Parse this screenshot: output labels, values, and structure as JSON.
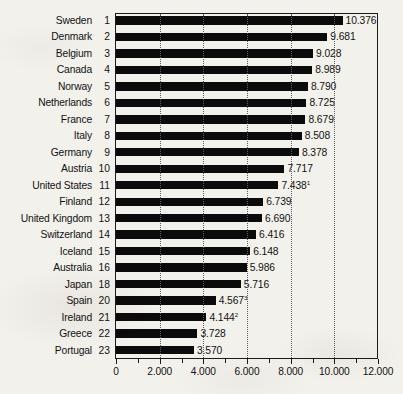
{
  "chart_data": {
    "type": "bar",
    "orientation": "horizontal",
    "title": "",
    "subtitle": "",
    "xlabel": "",
    "ylabel": "",
    "xlim": [
      0,
      12000
    ],
    "xticks": [
      0,
      2000,
      4000,
      6000,
      8000,
      10000,
      12000
    ],
    "xtick_labels": [
      "0",
      "2.000",
      "4.000",
      "6.000",
      "8.000",
      "10.000",
      "12.000"
    ],
    "minor_ticks": [
      1000,
      3000,
      5000,
      7000,
      9000,
      11000
    ],
    "grid": true,
    "grid_axis": "x",
    "grid_style": "dotted",
    "legend": null,
    "bar_color": "#0b0b0b",
    "categories": [
      "Sweden",
      "Denmark",
      "Belgium",
      "Canada",
      "Norway",
      "Netherlands",
      "France",
      "Italy",
      "Germany",
      "Austria",
      "United States",
      "Finland",
      "United Kingdom",
      "Switzerland",
      "Iceland",
      "Australia",
      "Japan",
      "Spain",
      "Ireland",
      "Greece",
      "Portugal"
    ],
    "ranks": [
      "1",
      "2",
      "3",
      "4",
      "5",
      "6",
      "7",
      "8",
      "9",
      "10",
      "11",
      "12",
      "13",
      "14",
      "15",
      "16",
      "18",
      "20",
      "21",
      "22",
      "23"
    ],
    "values": [
      10376,
      9681,
      9028,
      8989,
      8790,
      8725,
      8679,
      8508,
      8378,
      7717,
      7438,
      6739,
      6690,
      6416,
      6148,
      5986,
      5716,
      4567,
      4144,
      3728,
      3570
    ],
    "value_labels": [
      "10.376",
      "9.681",
      "9.028",
      "8.989",
      "8.790",
      "8.725",
      "8.679",
      "8.508",
      "8.378",
      "7.717",
      "7.438",
      "6.739",
      "6.690",
      "6.416",
      "6.148",
      "5.986",
      "5.716",
      "4.567",
      "4.144",
      "3.728",
      "3.570"
    ],
    "value_footnotes": [
      "",
      "",
      "",
      "",
      "",
      "",
      "",
      "",
      "",
      "",
      "1",
      "",
      "",
      "",
      "",
      "",
      "",
      "3",
      "2",
      "",
      ""
    ],
    "rows": [
      {
        "category": "Sweden",
        "rank": "1",
        "value": 10376,
        "label": "10.376",
        "footnote": ""
      },
      {
        "category": "Denmark",
        "rank": "2",
        "value": 9681,
        "label": "9.681",
        "footnote": ""
      },
      {
        "category": "Belgium",
        "rank": "3",
        "value": 9028,
        "label": "9.028",
        "footnote": ""
      },
      {
        "category": "Canada",
        "rank": "4",
        "value": 8989,
        "label": "8.989",
        "footnote": ""
      },
      {
        "category": "Norway",
        "rank": "5",
        "value": 8790,
        "label": "8.790",
        "footnote": ""
      },
      {
        "category": "Netherlands",
        "rank": "6",
        "value": 8725,
        "label": "8.725",
        "footnote": ""
      },
      {
        "category": "France",
        "rank": "7",
        "value": 8679,
        "label": "8.679",
        "footnote": ""
      },
      {
        "category": "Italy",
        "rank": "8",
        "value": 8508,
        "label": "8.508",
        "footnote": ""
      },
      {
        "category": "Germany",
        "rank": "9",
        "value": 8378,
        "label": "8.378",
        "footnote": ""
      },
      {
        "category": "Austria",
        "rank": "10",
        "value": 7717,
        "label": "7.717",
        "footnote": ""
      },
      {
        "category": "United States",
        "rank": "11",
        "value": 7438,
        "label": "7.438",
        "footnote": "1"
      },
      {
        "category": "Finland",
        "rank": "12",
        "value": 6739,
        "label": "6.739",
        "footnote": ""
      },
      {
        "category": "United Kingdom",
        "rank": "13",
        "value": 6690,
        "label": "6.690",
        "footnote": ""
      },
      {
        "category": "Switzerland",
        "rank": "14",
        "value": 6416,
        "label": "6.416",
        "footnote": ""
      },
      {
        "category": "Iceland",
        "rank": "15",
        "value": 6148,
        "label": "6.148",
        "footnote": ""
      },
      {
        "category": "Australia",
        "rank": "16",
        "value": 5986,
        "label": "5.986",
        "footnote": ""
      },
      {
        "category": "Japan",
        "rank": "18",
        "value": 5716,
        "label": "5.716",
        "footnote": ""
      },
      {
        "category": "Spain",
        "rank": "20",
        "value": 4567,
        "label": "4.567",
        "footnote": "3"
      },
      {
        "category": "Ireland",
        "rank": "21",
        "value": 4144,
        "label": "4.144",
        "footnote": "2"
      },
      {
        "category": "Greece",
        "rank": "22",
        "value": 3728,
        "label": "3.728",
        "footnote": ""
      },
      {
        "category": "Portugal",
        "rank": "23",
        "value": 3570,
        "label": "3.570",
        "footnote": ""
      }
    ]
  }
}
